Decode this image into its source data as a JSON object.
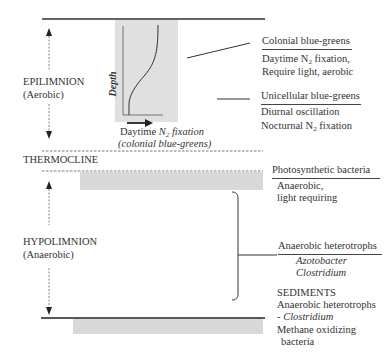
{
  "layers": {
    "epilimnion": {
      "name": "EPILIMNION",
      "condition": "(Aerobic)"
    },
    "thermocline": {
      "name": "THERMOCLINE"
    },
    "hypolimnion": {
      "name": "HYPOLIMNION",
      "condition": "(Anaerobic)"
    }
  },
  "inset_graph": {
    "y_axis_label": "Depth",
    "x_axis_label_prefix": "Daytime ",
    "x_axis_label_n": "N",
    "x_axis_label_sub": "2",
    "x_axis_label_suffix": " fixation",
    "x_axis_caption": "(colonial blue-greens)"
  },
  "annotations": {
    "colonial": {
      "title": "Colonial blue-greens",
      "line1_prefix": "Daytime  N",
      "line1_sub": "2",
      "line1_suffix": " fixation,",
      "line2": "Require light, aerobic"
    },
    "unicellular": {
      "title": "Unicellular blue-greens",
      "line1": "Diurnal oscillation",
      "line2_prefix": "Nocturnal N",
      "line2_sub": "2",
      "line2_suffix": " fixation"
    },
    "photosynthetic": {
      "title": "Photosynthetic bacteria",
      "line1": "Anaerobic,",
      "line2": "light requiring"
    },
    "anaerobic_heterotrophs": {
      "title": "Anaerobic heterotrophs",
      "line1": "Azotobacter",
      "line2": "Clostridium"
    },
    "sediments": {
      "title": "SEDIMENTS",
      "line1": "Anaerobic heterotrophs",
      "line2_prefix": "- ",
      "line2_italic": "Clostridium",
      "line3": "Methane oxidizing",
      "line4": "bacteria"
    }
  },
  "colors": {
    "line": "#333333",
    "grey_band": "#d9d9d9",
    "inset_bg": "#e0e0e0"
  }
}
